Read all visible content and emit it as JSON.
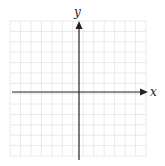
{
  "diagram": {
    "type": "coordinate-plane",
    "axis_labels": {
      "x": "x",
      "y": "y"
    },
    "grid": {
      "x_min_px": 10,
      "x_max_px": 146,
      "y_min_px": 21,
      "y_max_px": 156,
      "divisions": 13,
      "line_color": "#e4e4e4"
    },
    "axes": {
      "origin_px": [
        79,
        92
      ],
      "color": "#222222"
    }
  }
}
